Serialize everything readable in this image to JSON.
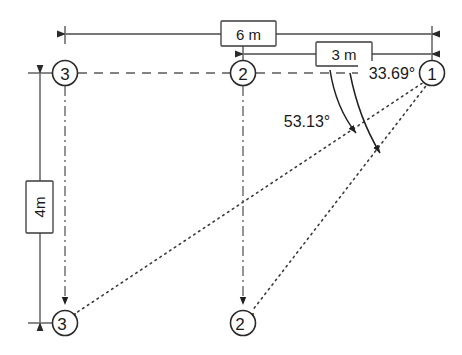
{
  "diagram": {
    "colors": {
      "line": "#4a4a4a",
      "dark": "#1f1f1f",
      "background": "#ffffff",
      "text": "#1a1a1a"
    },
    "nodes": [
      {
        "id": "node-1",
        "label": "1",
        "prime": "",
        "x": 432,
        "y": 73
      },
      {
        "id": "node-2",
        "label": "2",
        "prime": "",
        "x": 243,
        "y": 73
      },
      {
        "id": "node-3",
        "label": "3",
        "prime": "",
        "x": 65,
        "y": 73
      },
      {
        "id": "node-2p",
        "label": "2",
        "prime": "'",
        "x": 243,
        "y": 323
      },
      {
        "id": "node-3p",
        "label": "3",
        "prime": "'",
        "x": 65,
        "y": 323
      }
    ],
    "dimensions": [
      {
        "id": "dim-6m",
        "label": "6 m",
        "from": "3",
        "to": "1",
        "value": 6,
        "unit": "m",
        "orientation": "horizontal",
        "y": 34
      },
      {
        "id": "dim-3m",
        "label": "3 m",
        "from": "2",
        "to": "1",
        "value": 3,
        "unit": "m",
        "orientation": "horizontal",
        "y": 54
      },
      {
        "id": "dim-4m",
        "label": "4m",
        "from": "3",
        "to": "3'",
        "value": 4,
        "unit": "m",
        "orientation": "vertical",
        "x": 40
      }
    ],
    "angles": [
      {
        "id": "angle-inner",
        "label": "33.69°",
        "value": 33.69,
        "unit": "deg",
        "boxed": true,
        "vertex": "1",
        "ray": "1-2'"
      },
      {
        "id": "angle-outer",
        "label": "53.13°",
        "value": 53.13,
        "unit": "deg",
        "boxed": false,
        "vertex": "1",
        "ray": "1-3'"
      }
    ],
    "links": [
      {
        "id": "link-3-2-1",
        "style": "dashed",
        "description": "horizontal datum line through nodes 3, 2, 1"
      },
      {
        "id": "link-3-3p",
        "style": "dash-dot",
        "description": "vertical path node 3 to 3-prime"
      },
      {
        "id": "link-2-2p",
        "style": "dash-dot",
        "description": "vertical path node 2 to 2-prime"
      },
      {
        "id": "link-1-3p",
        "style": "dotted",
        "description": "ray from node 1 to 3-prime"
      },
      {
        "id": "link-1-2p",
        "style": "dotted",
        "description": "ray from node 1 to 2-prime"
      }
    ]
  }
}
